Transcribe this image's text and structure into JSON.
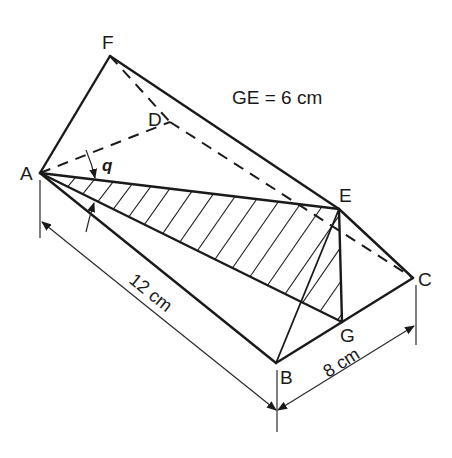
{
  "diagram": {
    "annotation": "GE = 6 cm",
    "angle_label": "q",
    "dimensions": {
      "length_AB": "12 cm",
      "width_BC": "8 cm"
    },
    "vertices": {
      "A": {
        "label": "A",
        "x": 40,
        "y": 173
      },
      "B": {
        "label": "B",
        "x": 276,
        "y": 363
      },
      "C": {
        "label": "C",
        "x": 413,
        "y": 278
      },
      "D": {
        "label": "D",
        "x": 170,
        "y": 122
      },
      "E": {
        "label": "E",
        "x": 339,
        "y": 209
      },
      "F": {
        "label": "F",
        "x": 110,
        "y": 56
      },
      "G": {
        "label": "G",
        "x": 342,
        "y": 322
      }
    },
    "shaded_region": "triangle AEG",
    "colors": {
      "ink": "#1a1a1a",
      "background": "#ffffff"
    }
  }
}
